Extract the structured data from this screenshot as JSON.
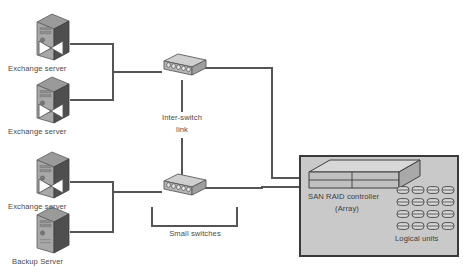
{
  "diagram": {
    "background_color": "#ffffff",
    "line_color": "#555555",
    "text_color": "#4a4a4a"
  },
  "nodes": {
    "servers": [
      {
        "id": "exchange-server-1",
        "label": "Exchange server",
        "type": "tower-server",
        "has_nic": true,
        "x": 28,
        "y": 12
      },
      {
        "id": "exchange-server-2",
        "label": "Exchange server",
        "type": "tower-server",
        "has_nic": true,
        "x": 28,
        "y": 75
      },
      {
        "id": "exchange-server-3",
        "label": "Exchange server",
        "type": "tower-server",
        "has_nic": true,
        "x": 28,
        "y": 150
      },
      {
        "id": "backup-server",
        "label": "Backup Server",
        "type": "tower-server",
        "has_nic": false,
        "x": 28,
        "y": 205
      }
    ],
    "switches": [
      {
        "id": "switch-top",
        "label": "",
        "type": "network-switch",
        "ports": 5,
        "x": 158,
        "y": 52
      },
      {
        "id": "switch-bottom",
        "label": "",
        "type": "network-switch",
        "ports": 5,
        "x": 158,
        "y": 172
      }
    ],
    "storage": {
      "id": "san-array",
      "box_label_line1": "SAN RAID controller",
      "box_label_line2": "(Array)",
      "logical_units_label": "Logical units",
      "controller_type": "raid-controller-slab",
      "logical_unit_rows": 4,
      "logical_unit_columns": 4,
      "logical_unit_count": 16,
      "fill_color": "#c9c9c9",
      "border_color": "#3a3a3a"
    }
  },
  "annotations": [
    {
      "id": "inter-switch-link",
      "line1": "Inter-switch",
      "line2": "link"
    },
    {
      "id": "small-switches",
      "line1": "Small switches",
      "line2": ""
    }
  ]
}
